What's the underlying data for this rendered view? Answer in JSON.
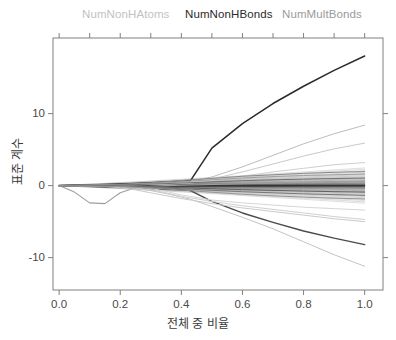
{
  "chart_data": {
    "type": "line",
    "title": "",
    "top_labels": [
      {
        "text": "NumNonHAtoms",
        "color": "#c2c2c2"
      },
      {
        "text": "NumNonHBonds",
        "color": "#2b2b2b"
      },
      {
        "text": "NumMultBonds",
        "color": "#9a9a9a"
      }
    ],
    "xlabel": "전체 중 비율",
    "ylabel": "표준 계수",
    "xlim": [
      -0.02,
      1.06
    ],
    "ylim": [
      -14.5,
      20.5
    ],
    "xticks": [
      0.0,
      0.2,
      0.4,
      0.6,
      0.8,
      1.0
    ],
    "xtick_labels": [
      "0.0",
      "0.2",
      "0.4",
      "0.6",
      "0.8",
      "1.0"
    ],
    "yticks": [
      -10,
      0,
      10
    ],
    "ytick_labels": [
      "-10",
      "0",
      "10"
    ],
    "grid": false,
    "legend_position": "top",
    "x": [
      0.0,
      0.05,
      0.1,
      0.15,
      0.2,
      0.25,
      0.3,
      0.35,
      0.4,
      0.43,
      0.5,
      0.6,
      0.7,
      0.8,
      0.9,
      1.0
    ],
    "series": [
      {
        "name": "NumNonHBonds",
        "color": "#2b2b2b",
        "width": 1.5,
        "values": [
          0,
          0.05,
          0.1,
          0.15,
          0.22,
          0.3,
          0.4,
          0.5,
          0.6,
          0.7,
          5.2,
          8.6,
          11.4,
          13.8,
          16.0,
          18.0
        ]
      },
      {
        "name": "NumNonHAtoms",
        "color": "#9e9e9e",
        "width": 1.1,
        "values": [
          0,
          -0.9,
          -2.4,
          -2.5,
          -1.0,
          -0.3,
          -0.1,
          0.0,
          0.05,
          0.08,
          0.15,
          0.25,
          0.35,
          0.45,
          0.55,
          0.6
        ]
      },
      {
        "name": "downtrend-dark",
        "color": "#4a4a4a",
        "width": 1.4,
        "values": [
          0,
          -0.05,
          -0.1,
          -0.15,
          -0.2,
          -0.3,
          -0.4,
          -0.5,
          -0.6,
          -0.7,
          -2.2,
          -3.8,
          -5.1,
          -6.3,
          -7.3,
          -8.2
        ]
      },
      {
        "name": "uptrend-light-1",
        "color": "#bdbdbd",
        "width": 1.0,
        "values": [
          0,
          0.02,
          0.05,
          0.1,
          0.15,
          0.2,
          0.3,
          0.4,
          0.5,
          0.6,
          1.2,
          2.6,
          4.2,
          5.8,
          7.2,
          8.4
        ]
      },
      {
        "name": "uptrend-light-2",
        "color": "#c9c9c9",
        "width": 1.0,
        "values": [
          0,
          0.01,
          0.03,
          0.06,
          0.1,
          0.15,
          0.2,
          0.3,
          0.4,
          0.5,
          0.9,
          1.9,
          3.0,
          4.1,
          5.1,
          5.9
        ]
      },
      {
        "name": "uptrend-light-3",
        "color": "#cfcfcf",
        "width": 1.0,
        "values": [
          0,
          0.01,
          0.02,
          0.04,
          0.07,
          0.1,
          0.15,
          0.2,
          0.3,
          0.35,
          0.7,
          1.3,
          1.9,
          2.4,
          2.9,
          3.2
        ]
      },
      {
        "name": "downtrend-light-1",
        "color": "#c4c4c4",
        "width": 1.0,
        "values": [
          0,
          -0.02,
          -0.05,
          -0.1,
          -0.2,
          -0.4,
          -0.7,
          -1.1,
          -1.6,
          -1.9,
          -2.9,
          -4.4,
          -6.0,
          -7.8,
          -9.6,
          -11.2
        ]
      },
      {
        "name": "downtrend-light-2",
        "color": "#cacaca",
        "width": 1.0,
        "values": [
          0,
          -0.02,
          -0.05,
          -0.12,
          -0.3,
          -0.6,
          -1.0,
          -1.4,
          -1.8,
          -2.0,
          -2.5,
          -3.1,
          -3.6,
          -4.1,
          -4.6,
          -5.0
        ]
      },
      {
        "name": "downtrend-light-3",
        "color": "#d0d0d0",
        "width": 1.0,
        "values": [
          0,
          -0.01,
          -0.03,
          -0.07,
          -0.15,
          -0.3,
          -0.6,
          -1.0,
          -1.5,
          -1.7,
          -2.2,
          -2.8,
          -3.3,
          -3.8,
          -4.3,
          -4.7
        ]
      },
      {
        "name": "downtrend-light-4",
        "color": "#d6d6d6",
        "width": 1.0,
        "values": [
          0,
          -0.01,
          -0.02,
          -0.05,
          -0.1,
          -0.2,
          -0.4,
          -0.8,
          -1.3,
          -1.5,
          -2.0,
          -2.4,
          -2.7,
          -3.0,
          -3.2,
          -3.4
        ]
      },
      {
        "name": "flat-band-1",
        "color": "#8a8a8a",
        "width": 1.0,
        "values": [
          0,
          0.02,
          0.05,
          0.1,
          0.18,
          0.28,
          0.4,
          0.55,
          0.7,
          0.8,
          1.0,
          1.3,
          1.5,
          1.7,
          1.85,
          1.95
        ]
      },
      {
        "name": "flat-band-2",
        "color": "#a0a0a0",
        "width": 1.0,
        "values": [
          0,
          0.01,
          0.03,
          0.07,
          0.12,
          0.2,
          0.3,
          0.42,
          0.55,
          0.62,
          0.8,
          1.05,
          1.25,
          1.4,
          1.5,
          1.6
        ]
      },
      {
        "name": "flat-band-3",
        "color": "#707070",
        "width": 1.0,
        "values": [
          0,
          0.01,
          0.02,
          0.05,
          0.09,
          0.14,
          0.2,
          0.28,
          0.36,
          0.4,
          0.52,
          0.68,
          0.8,
          0.9,
          0.98,
          1.05
        ]
      },
      {
        "name": "flat-band-4",
        "color": "#606060",
        "width": 1.0,
        "values": [
          0,
          -0.01,
          -0.02,
          -0.04,
          -0.07,
          -0.11,
          -0.16,
          -0.22,
          -0.29,
          -0.33,
          -0.43,
          -0.56,
          -0.67,
          -0.76,
          -0.84,
          -0.9
        ]
      },
      {
        "name": "flat-band-5",
        "color": "#787878",
        "width": 1.0,
        "values": [
          0,
          -0.01,
          -0.03,
          -0.06,
          -0.11,
          -0.17,
          -0.25,
          -0.34,
          -0.44,
          -0.5,
          -0.65,
          -0.85,
          -1.0,
          -1.15,
          -1.25,
          -1.35
        ]
      },
      {
        "name": "flat-band-6",
        "color": "#959595",
        "width": 1.0,
        "values": [
          0,
          -0.02,
          -0.04,
          -0.09,
          -0.15,
          -0.24,
          -0.35,
          -0.48,
          -0.62,
          -0.7,
          -0.92,
          -1.2,
          -1.42,
          -1.6,
          -1.75,
          -1.85
        ]
      }
    ]
  }
}
